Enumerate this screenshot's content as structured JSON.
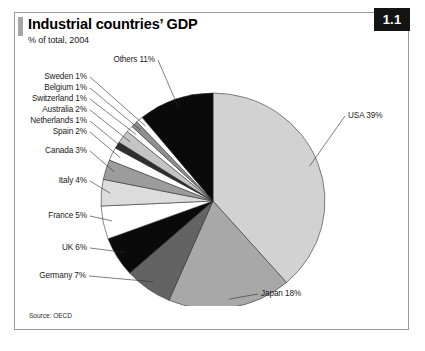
{
  "figure": {
    "badge": "1.1",
    "title": "Industrial countries’ GDP",
    "subtitle": "% of total, 2004",
    "source": "Source: OECD"
  },
  "chart_data": {
    "type": "pie",
    "title": "Industrial countries’ GDP",
    "subtitle": "% of total, 2004",
    "unit": "% of total",
    "year": 2004,
    "source": "Source: OECD",
    "start_angle_deg": 0,
    "direction": "clockwise",
    "legend": "none (direct labels with leader lines)",
    "categories": [
      "USA",
      "Japan",
      "Germany",
      "UK",
      "France",
      "Italy",
      "Canada",
      "Spain",
      "Netherlands",
      "Australia",
      "Switzerland",
      "Belgium",
      "Sweden",
      "Others"
    ],
    "values": [
      39,
      18,
      7,
      6,
      5,
      4,
      3,
      2,
      1,
      2,
      1,
      1,
      1,
      11
    ],
    "labels": [
      "USA 39%",
      "Japan 18%",
      "Germany 7%",
      "UK 6%",
      "France 5%",
      "Italy 4%",
      "Canada 3%",
      "Spain 2%",
      "Netherlands 1%",
      "Australia 2%",
      "Switzerland 1%",
      "Belgium 1%",
      "Sweden 1%",
      "Others 11%"
    ],
    "colors": [
      "#d2d2d2",
      "#a8a8a8",
      "#636363",
      "#0a0a0a",
      "#ffffff",
      "#dcdcdc",
      "#9c9c9c",
      "#ffffff",
      "#2e2e2e",
      "#c4c4c4",
      "#ffffff",
      "#8f8f8f",
      "#ffffff",
      "#0a0a0a"
    ]
  }
}
